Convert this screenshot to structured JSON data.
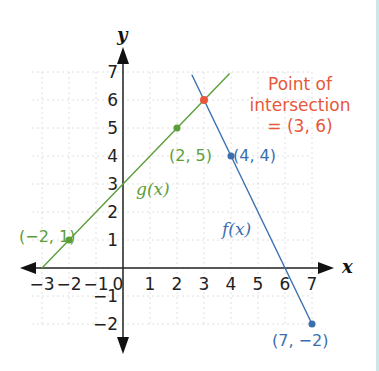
{
  "chart_data": {
    "type": "line",
    "title": "",
    "xlabel": "x",
    "ylabel": "y",
    "xlim": [
      -3,
      7
    ],
    "ylim": [
      -2,
      7
    ],
    "x_ticks": [
      "−3",
      "−2",
      "−1",
      "0",
      "1",
      "2",
      "3",
      "4",
      "5",
      "6",
      "7"
    ],
    "y_ticks": [
      "−2",
      "−1",
      "1",
      "2",
      "3",
      "4",
      "5",
      "6",
      "7"
    ],
    "grid": true,
    "series": [
      {
        "name": "g(x)",
        "label": "g(x)",
        "color": "#5a9e3a",
        "equation": "y = x + 3",
        "points": [
          {
            "x": -2,
            "y": 1,
            "label": "(−2, 1)"
          },
          {
            "x": 2,
            "y": 5,
            "label": "(2, 5)"
          }
        ]
      },
      {
        "name": "f(x)",
        "label": "f(x)",
        "color": "#3a6fb0",
        "equation": "y = -2x + 12",
        "points": [
          {
            "x": 4,
            "y": 4,
            "label": "(4, 4)"
          },
          {
            "x": 7,
            "y": -2,
            "label": "(7, −2)"
          }
        ]
      }
    ],
    "annotations": [
      {
        "text_lines": [
          "Point of",
          "intersection",
          "= (3, 6)"
        ],
        "point": {
          "x": 3,
          "y": 6
        },
        "color": "#e8573a"
      }
    ]
  },
  "colors": {
    "g": "#5a9e3a",
    "f": "#3a6fb0",
    "intersection": "#e8573a",
    "axis": "#222222",
    "grid": "#d8d8d8",
    "border": "#cfe6e8"
  }
}
